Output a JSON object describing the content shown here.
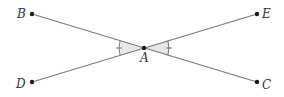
{
  "figure": {
    "type": "intersecting-lines",
    "points": {
      "A": {
        "label": "A",
        "x": 144,
        "y": 48
      },
      "B": {
        "label": "B",
        "x": 32,
        "y": 14
      },
      "C": {
        "label": "C",
        "x": 257,
        "y": 82
      },
      "D": {
        "label": "D",
        "x": 32,
        "y": 82
      },
      "E": {
        "label": "E",
        "x": 257,
        "y": 14
      }
    },
    "segments": [
      {
        "name": "BC",
        "from": "B",
        "to": "C"
      },
      {
        "name": "DE",
        "from": "D",
        "to": "E"
      }
    ],
    "angle_marks": [
      {
        "name": "angle-BAD",
        "vertex": "A",
        "sides": [
          "B",
          "D"
        ],
        "ticks": 1,
        "shaded": true
      },
      {
        "name": "angle-EAC",
        "vertex": "A",
        "sides": [
          "E",
          "C"
        ],
        "ticks": 1,
        "shaded": true
      }
    ],
    "colors": {
      "line": "#7a7a7a",
      "point": "#1a1a1a",
      "shade": "#e6e6e6",
      "label": "#333333"
    }
  },
  "labels": {
    "A": "A",
    "B": "B",
    "C": "C",
    "D": "D",
    "E": "E"
  }
}
